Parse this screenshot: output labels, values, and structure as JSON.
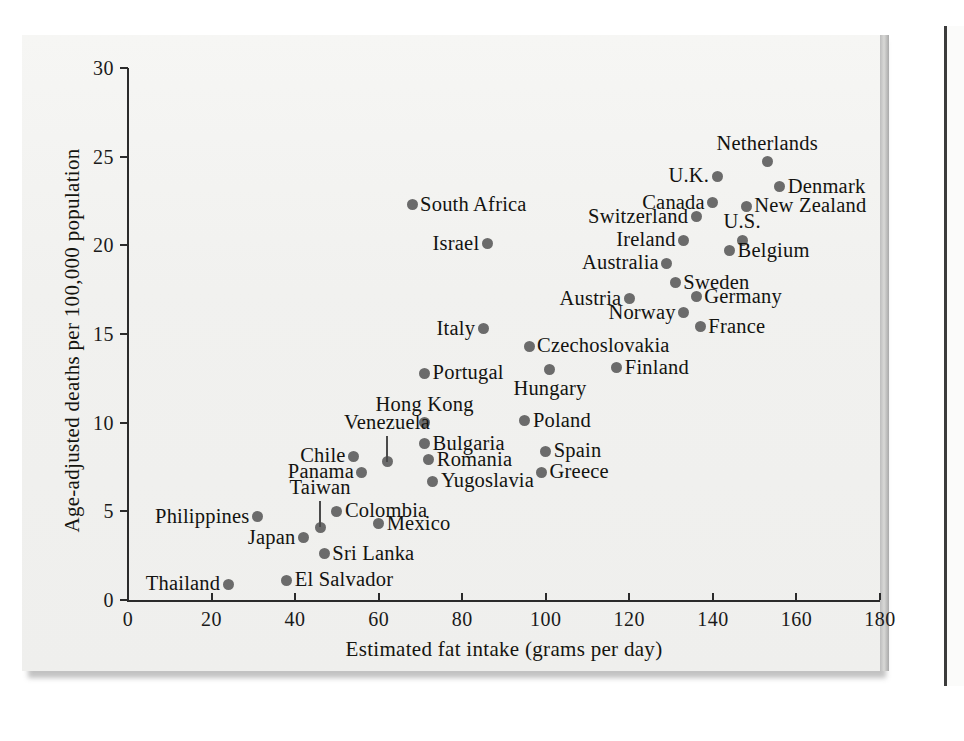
{
  "figure": {
    "background_color": "#f2f2f0",
    "point_color": "#6b6b6b",
    "axis_color": "#2b2b2b"
  },
  "chart_data": {
    "type": "scatter",
    "title": "",
    "xlabel": "Estimated fat intake (grams per day)",
    "ylabel": "Age-adjusted deaths per 100,000 population",
    "xlim": [
      0,
      180
    ],
    "ylim": [
      0,
      30
    ],
    "xticks": [
      0,
      20,
      40,
      60,
      80,
      100,
      120,
      140,
      160,
      180
    ],
    "yticks": [
      0,
      5,
      10,
      15,
      20,
      25,
      30
    ],
    "grid": false,
    "legend": "none",
    "point_label_field": "country",
    "points": [
      {
        "country": "Netherlands",
        "x": 153,
        "y": 24.7,
        "label_pos": "above"
      },
      {
        "country": "U.K.",
        "x": 141,
        "y": 23.9,
        "label_pos": "left"
      },
      {
        "country": "Denmark",
        "x": 156,
        "y": 23.3,
        "label_pos": "right"
      },
      {
        "country": "Canada",
        "x": 140,
        "y": 22.4,
        "label_pos": "left"
      },
      {
        "country": "New Zealand",
        "x": 148,
        "y": 22.2,
        "label_pos": "right"
      },
      {
        "country": "South Africa",
        "x": 68,
        "y": 22.3,
        "label_pos": "right"
      },
      {
        "country": "Switzerland",
        "x": 136,
        "y": 21.6,
        "label_pos": "left"
      },
      {
        "country": "Ireland",
        "x": 133,
        "y": 20.3,
        "label_pos": "left"
      },
      {
        "country": "U.S.",
        "x": 147,
        "y": 20.3,
        "label_pos": "above"
      },
      {
        "country": "Israel",
        "x": 86,
        "y": 20.1,
        "label_pos": "left"
      },
      {
        "country": "Belgium",
        "x": 144,
        "y": 19.7,
        "label_pos": "right"
      },
      {
        "country": "Australia",
        "x": 129,
        "y": 19.0,
        "label_pos": "left"
      },
      {
        "country": "Sweden",
        "x": 131,
        "y": 17.9,
        "label_pos": "right"
      },
      {
        "country": "Germany",
        "x": 136,
        "y": 17.1,
        "label_pos": "right"
      },
      {
        "country": "Austria",
        "x": 120,
        "y": 17.0,
        "label_pos": "left"
      },
      {
        "country": "Norway",
        "x": 133,
        "y": 16.2,
        "label_pos": "left"
      },
      {
        "country": "France",
        "x": 137,
        "y": 15.4,
        "label_pos": "right"
      },
      {
        "country": "Italy",
        "x": 85,
        "y": 15.3,
        "label_pos": "left"
      },
      {
        "country": "Czechoslovakia",
        "x": 96,
        "y": 14.3,
        "label_pos": "right"
      },
      {
        "country": "Finland",
        "x": 117,
        "y": 13.1,
        "label_pos": "right"
      },
      {
        "country": "Hungary",
        "x": 101,
        "y": 13.0,
        "label_pos": "below"
      },
      {
        "country": "Portugal",
        "x": 71,
        "y": 12.8,
        "label_pos": "right"
      },
      {
        "country": "Hong Kong",
        "x": 71,
        "y": 10.0,
        "label_pos": "above"
      },
      {
        "country": "Poland",
        "x": 95,
        "y": 10.1,
        "label_pos": "right"
      },
      {
        "country": "Bulgaria",
        "x": 71,
        "y": 8.8,
        "label_pos": "right"
      },
      {
        "country": "Spain",
        "x": 100,
        "y": 8.4,
        "label_pos": "right"
      },
      {
        "country": "Chile",
        "x": 54,
        "y": 8.1,
        "label_pos": "left"
      },
      {
        "country": "Venezuela",
        "x": 62,
        "y": 7.8,
        "label_pos": "leader-up"
      },
      {
        "country": "Romania",
        "x": 72,
        "y": 7.9,
        "label_pos": "right"
      },
      {
        "country": "Greece",
        "x": 99,
        "y": 7.2,
        "label_pos": "right"
      },
      {
        "country": "Panama",
        "x": 56,
        "y": 7.2,
        "label_pos": "left"
      },
      {
        "country": "Yugoslavia",
        "x": 73,
        "y": 6.7,
        "label_pos": "right"
      },
      {
        "country": "Colombia",
        "x": 50,
        "y": 5.0,
        "label_pos": "right"
      },
      {
        "country": "Philippines",
        "x": 31,
        "y": 4.7,
        "label_pos": "left"
      },
      {
        "country": "Taiwan",
        "x": 46,
        "y": 4.1,
        "label_pos": "leader-up"
      },
      {
        "country": "Mexico",
        "x": 60,
        "y": 4.3,
        "label_pos": "right"
      },
      {
        "country": "Japan",
        "x": 42,
        "y": 3.5,
        "label_pos": "left"
      },
      {
        "country": "Sri Lanka",
        "x": 47,
        "y": 2.6,
        "label_pos": "right"
      },
      {
        "country": "El Salvador",
        "x": 38,
        "y": 1.1,
        "label_pos": "right"
      },
      {
        "country": "Thailand",
        "x": 24,
        "y": 0.9,
        "label_pos": "left"
      }
    ]
  }
}
